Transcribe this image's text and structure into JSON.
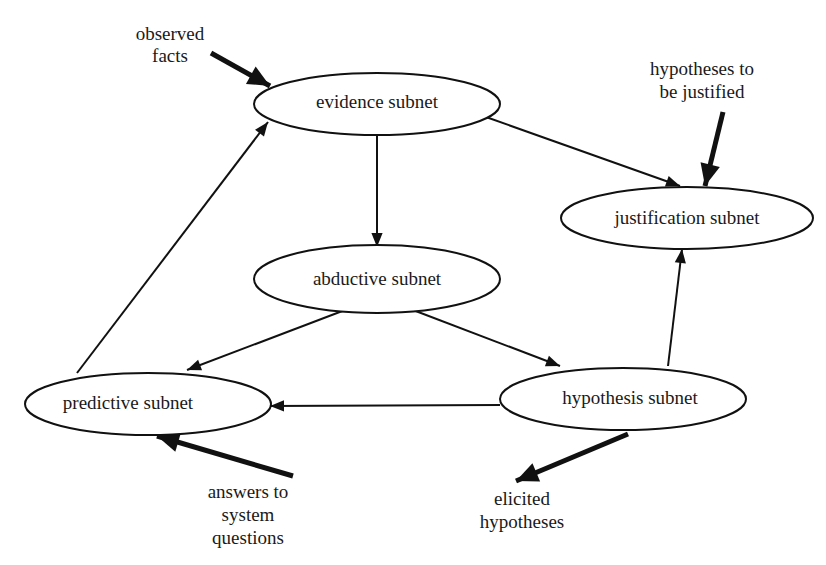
{
  "diagram": {
    "type": "directed-graph",
    "nodes": [
      {
        "id": "evidence",
        "label": "evidence subnet"
      },
      {
        "id": "abductive",
        "label": "abductive subnet"
      },
      {
        "id": "justification",
        "label": "justification subnet"
      },
      {
        "id": "predictive",
        "label": "predictive subnet"
      },
      {
        "id": "hypothesis",
        "label": "hypothesis subnet"
      }
    ],
    "edges": [
      {
        "from": "evidence",
        "to": "abductive"
      },
      {
        "from": "abductive",
        "to": "predictive"
      },
      {
        "from": "abductive",
        "to": "hypothesis"
      },
      {
        "from": "hypothesis",
        "to": "predictive"
      },
      {
        "from": "hypothesis",
        "to": "justification"
      },
      {
        "from": "predictive",
        "to": "evidence"
      },
      {
        "from": "justification",
        "to": "evidence",
        "bidirectional": true
      }
    ],
    "external_inputs": [
      {
        "label_lines": [
          "observed",
          "facts"
        ],
        "to": "evidence"
      },
      {
        "label_lines": [
          "hypotheses to",
          "be justified"
        ],
        "to": "justification"
      },
      {
        "label_lines": [
          "answers to",
          "system",
          "questions"
        ],
        "to": "predictive"
      }
    ],
    "external_outputs": [
      {
        "label_lines": [
          "elicited",
          "hypotheses"
        ],
        "from": "hypothesis"
      }
    ]
  }
}
